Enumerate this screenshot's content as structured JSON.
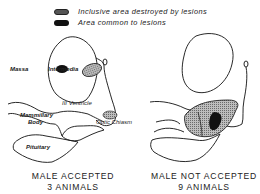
{
  "legend": {
    "items": [
      {
        "label": "Inclusive area destroyed by lesions",
        "swatch": "stippled-gray"
      },
      {
        "label": "Area common to lesions",
        "swatch": "solid-black"
      }
    ]
  },
  "left_panel": {
    "labels": {
      "massa": "Massa",
      "intermedia": "Intermedia",
      "ventricle": "III Ventricle",
      "mammillary_line1": "Mammillary",
      "mammillary_line2": "Body",
      "optic_chiasm": "Optic Chiasm",
      "pituitary": "Pituitary"
    },
    "caption_line1": "MALE ACCEPTED",
    "caption_line2": "3 ANIMALS"
  },
  "right_panel": {
    "caption_line1": "MALE NOT ACCEPTED",
    "caption_line2": "9 ANIMALS"
  },
  "colors": {
    "lesion_inclusive": "#9a9a9a",
    "lesion_common": "#111111",
    "outline": "#111111"
  }
}
